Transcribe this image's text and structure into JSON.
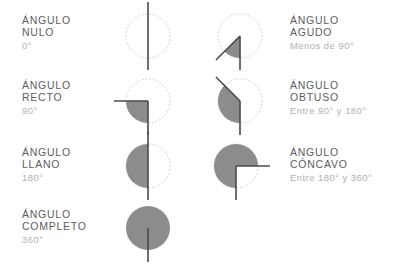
{
  "page": {
    "language": "es",
    "background_color": "#ffffff",
    "title_color": "#5d5d5d",
    "subtitle_color": "#b0b0b0",
    "fill_color": "#8c8c8c",
    "stroke_color": "#4a4a4a",
    "dotted_color": "#cfcfcf"
  },
  "items": [
    {
      "id": "nulo",
      "title_line1": "ÁNGULO",
      "title_line2": "NULO",
      "subtitle": "0°",
      "degrees": 0,
      "side": "left",
      "label_x": 22,
      "label_y": 14,
      "fig_x": 108,
      "fig_y": -4,
      "start_deg": 270,
      "sweep_deg": 0,
      "rays": [
        270
      ],
      "filled": false,
      "dotted_circle": true
    },
    {
      "id": "agudo",
      "title_line1": "ÁNGULO",
      "title_line2": "AGUDO",
      "subtitle": "Menos de 90°",
      "degrees": 45,
      "side": "right",
      "label_x": 290,
      "label_y": 14,
      "fig_x": 200,
      "fig_y": -4,
      "start_deg": 225,
      "sweep_deg": 45,
      "rays": [
        225,
        270
      ],
      "filled": true,
      "dotted_circle": true
    },
    {
      "id": "recto",
      "title_line1": "ÁNGULO",
      "title_line2": "RECTO",
      "subtitle": "90°",
      "degrees": 90,
      "side": "left",
      "label_x": 22,
      "label_y": 79,
      "fig_x": 108,
      "fig_y": 61,
      "start_deg": 180,
      "sweep_deg": 90,
      "rays": [
        180,
        270
      ],
      "filled": true,
      "dotted_circle": true
    },
    {
      "id": "obtuso",
      "title_line1": "ÁNGULO",
      "title_line2": "OBTUSO",
      "subtitle": "Entre 90° y 180°",
      "degrees": 135,
      "side": "right",
      "label_x": 290,
      "label_y": 79,
      "fig_x": 200,
      "fig_y": 61,
      "start_deg": 135,
      "sweep_deg": 135,
      "rays": [
        135,
        270
      ],
      "filled": true,
      "dotted_circle": true
    },
    {
      "id": "llano",
      "title_line1": "ÁNGULO",
      "title_line2": "LLANO",
      "subtitle": "180°",
      "degrees": 180,
      "side": "left",
      "label_x": 22,
      "label_y": 146,
      "fig_x": 108,
      "fig_y": 126,
      "start_deg": 90,
      "sweep_deg": 180,
      "rays": [
        90,
        270
      ],
      "filled": true,
      "dotted_circle": true
    },
    {
      "id": "concavo",
      "title_line1": "ÁNGULO",
      "title_line2": "CÓNCAVO",
      "subtitle": "Entre 180° y 360°",
      "degrees": 270,
      "side": "right",
      "label_x": 290,
      "label_y": 146,
      "fig_x": 196,
      "fig_y": 126,
      "start_deg": 0,
      "sweep_deg": 270,
      "rays": [
        0,
        270
      ],
      "filled": true,
      "dotted_circle": true
    },
    {
      "id": "completo",
      "title_line1": "ÁNGULO",
      "title_line2": "COMPLETO",
      "subtitle": "360°",
      "degrees": 360,
      "side": "left",
      "label_x": 22,
      "label_y": 208,
      "fig_x": 108,
      "fig_y": 188,
      "start_deg": 270,
      "sweep_deg": 360,
      "rays": [
        270
      ],
      "filled": true,
      "dotted_circle": false
    }
  ]
}
